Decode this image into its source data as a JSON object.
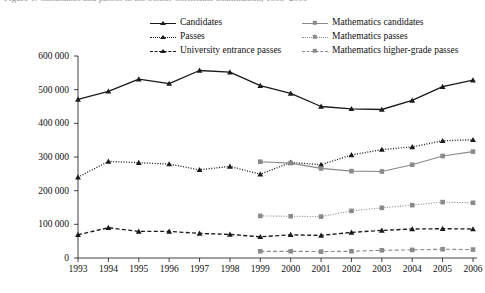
{
  "caption_remnant": "Figure 1.  Candidates and passes in the Senior Certificate examination, 1993–2006",
  "axes": {
    "y_ticks": [
      "0",
      "100 000",
      "200 000",
      "300 000",
      "400 000",
      "500 000",
      "600 000"
    ],
    "y_values": [
      0,
      100000,
      200000,
      300000,
      400000,
      500000,
      600000
    ],
    "y_min": 0,
    "y_max": 600000,
    "x_ticks": [
      "1993",
      "1994",
      "1995",
      "1996",
      "1997",
      "1998",
      "1999",
      "2000",
      "2001",
      "2002",
      "2003",
      "2004",
      "2005",
      "2006"
    ]
  },
  "legend": {
    "items": [
      {
        "label": "Candidates",
        "key": "solid-triangle-black",
        "color": "#1a1a1a",
        "dash": "solid",
        "marker": "triangle"
      },
      {
        "label": "Passes",
        "key": "dotted-triangle-black",
        "color": "#1a1a1a",
        "dash": "dotted",
        "marker": "triangle"
      },
      {
        "label": "University entrance passes",
        "key": "dashed-triangle-black",
        "color": "#1a1a1a",
        "dash": "dashed",
        "marker": "triangle"
      },
      {
        "label": "Mathematics candidates",
        "key": "solid-square-grey",
        "color": "#8a8a8a",
        "dash": "solid",
        "marker": "square"
      },
      {
        "label": "Mathematics passes",
        "key": "dotted-square-grey",
        "color": "#8a8a8a",
        "dash": "dotted",
        "marker": "square"
      },
      {
        "label": "Mathematics higher-grade passes",
        "key": "dashed-square-grey",
        "color": "#8a8a8a",
        "dash": "dashed",
        "marker": "square"
      }
    ]
  },
  "chart_data": {
    "type": "line",
    "title": "",
    "xlabel": "",
    "ylabel": "",
    "ylim": [
      0,
      600000
    ],
    "ytick_step": 100000,
    "grid": false,
    "legend_position": "top",
    "x": [
      1993,
      1994,
      1995,
      1996,
      1997,
      1998,
      1999,
      2000,
      2001,
      2002,
      2003,
      2004,
      2005,
      2006
    ],
    "categories": [
      "1993",
      "1994",
      "1995",
      "1996",
      "1997",
      "1998",
      "1999",
      "2000",
      "2001",
      "2002",
      "2003",
      "2004",
      "2005",
      "2006"
    ],
    "series": [
      {
        "name": "Candidates",
        "color": "#1a1a1a",
        "dash": "solid",
        "marker": "triangle",
        "x": [
          1993,
          1994,
          1995,
          1996,
          1997,
          1998,
          1999,
          2000,
          2001,
          2002,
          2003,
          2004,
          2005,
          2006
        ],
        "values": [
          471000,
          495000,
          531000,
          518000,
          557000,
          552000,
          512000,
          489000,
          450000,
          443000,
          441000,
          468000,
          509000,
          528000
        ]
      },
      {
        "name": "Passes",
        "color": "#1a1a1a",
        "dash": "dotted",
        "marker": "triangle",
        "x": [
          1993,
          1994,
          1995,
          1996,
          1997,
          1998,
          1999,
          2000,
          2001,
          2002,
          2003,
          2004,
          2005,
          2006
        ],
        "values": [
          240000,
          287000,
          283000,
          279000,
          262000,
          272000,
          249000,
          284000,
          277000,
          306000,
          322000,
          330000,
          348000,
          351000
        ]
      },
      {
        "name": "University entrance passes",
        "color": "#1a1a1a",
        "dash": "dashed",
        "marker": "triangle",
        "x": [
          1993,
          1994,
          1995,
          1996,
          1997,
          1998,
          1999,
          2000,
          2001,
          2002,
          2003,
          2004,
          2005,
          2006
        ],
        "values": [
          69000,
          90000,
          79000,
          79000,
          73000,
          70000,
          63000,
          69000,
          67000,
          76000,
          82000,
          86000,
          87000,
          86000
        ]
      },
      {
        "name": "Mathematics candidates",
        "color": "#8a8a8a",
        "dash": "solid",
        "marker": "square",
        "x": [
          1999,
          2000,
          2001,
          2002,
          2003,
          2004,
          2005,
          2006
        ],
        "values": [
          286000,
          282000,
          266000,
          258000,
          257000,
          277000,
          303000,
          316000
        ]
      },
      {
        "name": "Mathematics passes",
        "color": "#8a8a8a",
        "dash": "dotted",
        "marker": "square",
        "x": [
          1999,
          2000,
          2001,
          2002,
          2003,
          2004,
          2005,
          2006
        ],
        "values": [
          125000,
          124000,
          123000,
          140000,
          149000,
          157000,
          166000,
          164000
        ]
      },
      {
        "name": "Mathematics higher-grade passes",
        "color": "#8a8a8a",
        "dash": "dashed",
        "marker": "square",
        "x": [
          1999,
          2000,
          2001,
          2002,
          2003,
          2004,
          2005,
          2006
        ],
        "values": [
          20000,
          20000,
          19000,
          20000,
          23000,
          24000,
          26000,
          25000
        ]
      }
    ]
  }
}
